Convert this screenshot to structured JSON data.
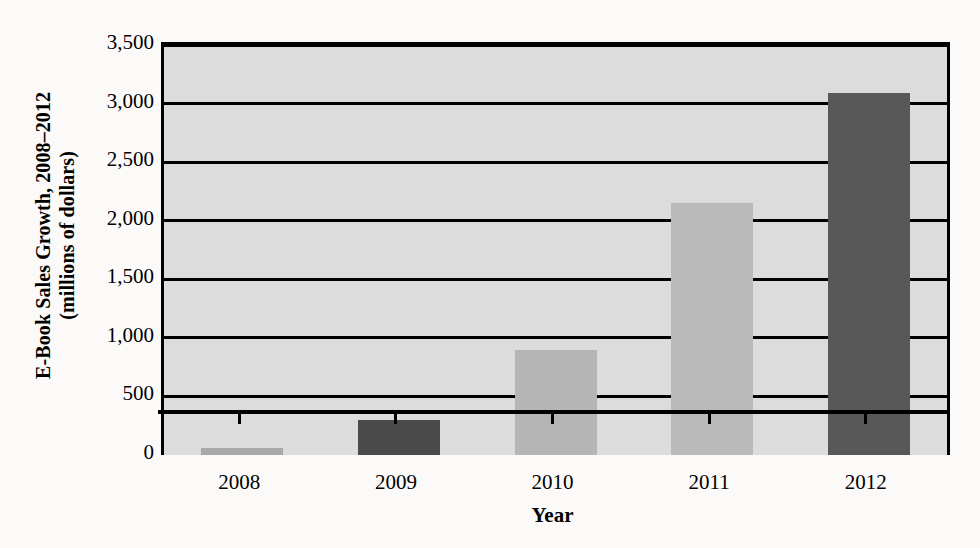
{
  "chart_data": {
    "type": "bar",
    "title": "",
    "subtitle": "",
    "categories": [
      "2008",
      "2009",
      "2010",
      "2011",
      "2012"
    ],
    "values": [
      60,
      300,
      900,
      2150,
      3090
    ],
    "series": [
      {
        "name": "E-Book Sales Growth",
        "values": [
          60,
          300,
          900,
          2150,
          3090
        ]
      }
    ],
    "xlabel": "Year",
    "ylabel_line1": "E-Book Sales Growth, 2008–2012",
    "ylabel_line2": "(millions of dollars)",
    "ylabel": "E-Book Sales Growth, 2008–2012 (millions of dollars)",
    "ylim": [
      0,
      3500
    ],
    "yticks": [
      "3,500",
      "3,000",
      "2,500",
      "2,000",
      "1,500",
      "1,000",
      "500",
      "0"
    ],
    "ytick_values": [
      3500,
      3000,
      2500,
      2000,
      1500,
      1000,
      500,
      0
    ],
    "grid": true,
    "legend": "none",
    "bar_colors": [
      "#a9a9a9",
      "#4a4a4a",
      "#b5b5b5",
      "#bababa",
      "#585858"
    ],
    "plot_background": "#dcdcdc",
    "page_background": "#fbfaf8",
    "axis_color": "#000000"
  }
}
